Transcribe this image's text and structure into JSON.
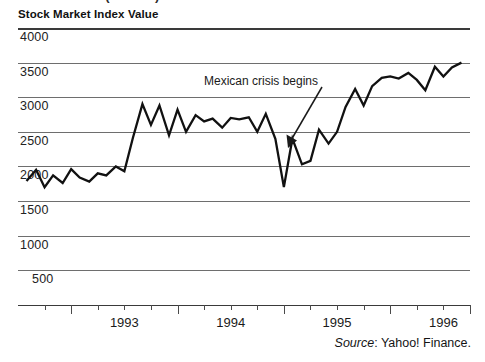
{
  "clipped_header": "Stock Market (Mexico)",
  "chart_title": "Stock Market Index Value",
  "source": {
    "word": "Source",
    "rest": ": Yahoo! Finance."
  },
  "annotation": {
    "text": "Mexican crisis begins"
  },
  "colors": {
    "line": "#111111",
    "grid": "#6e6e6e",
    "axis": "#3a3a3a",
    "text": "#1a1a1a",
    "background": "#ffffff"
  },
  "chart_data": {
    "type": "line",
    "title": "Stock Market Index Value",
    "xlabel": "",
    "ylabel": "Stock Market Index Value",
    "ylim": [
      0,
      4000
    ],
    "yticks": [
      4000,
      3500,
      3000,
      2500,
      2000,
      1500,
      1000,
      500
    ],
    "ytick_labels": [
      "4000",
      "3500",
      "3000",
      "2500",
      "2000",
      "1500",
      "1000",
      "500"
    ],
    "grid": true,
    "legend": false,
    "xlim": [
      1992.5,
      1996.75
    ],
    "xticks": [
      1993,
      1994,
      1995,
      1996
    ],
    "xtick_labels": [
      "1993",
      "1994",
      "1995",
      "1996"
    ],
    "minor_xticks": [
      1992.75,
      1993.25,
      1993.5,
      1993.75,
      1994.25,
      1994.5,
      1994.75,
      1995.25,
      1995.5,
      1995.75,
      1996.25,
      1996.5
    ],
    "annotations": [
      {
        "text": "Mexican crisis begins",
        "point_x": 1994.82,
        "point_y": 2450,
        "label_x": 1994.35,
        "label_y": 3330
      }
    ],
    "series": [
      {
        "name": "Stock Market Index Value",
        "x": [
          1992.58,
          1992.67,
          1992.75,
          1992.83,
          1992.92,
          1993.0,
          1993.08,
          1993.17,
          1993.25,
          1993.33,
          1993.42,
          1993.5,
          1993.58,
          1993.67,
          1993.75,
          1993.83,
          1993.92,
          1994.0,
          1994.08,
          1994.17,
          1994.25,
          1994.33,
          1994.42,
          1994.5,
          1994.58,
          1994.67,
          1994.75,
          1994.83,
          1994.92,
          1995.0,
          1995.08,
          1995.17,
          1995.25,
          1995.33,
          1995.42,
          1995.5,
          1995.58,
          1995.67,
          1995.75,
          1995.83,
          1995.92,
          1996.0,
          1996.08,
          1996.17,
          1996.25,
          1996.33,
          1996.42,
          1996.5,
          1996.58,
          1996.67
        ],
        "y": [
          1790,
          1950,
          1700,
          1870,
          1760,
          1960,
          1840,
          1780,
          1900,
          1870,
          2000,
          1930,
          2410,
          2900,
          2600,
          2880,
          2450,
          2820,
          2500,
          2740,
          2650,
          2690,
          2560,
          2700,
          2680,
          2710,
          2500,
          2760,
          2400,
          1700,
          2400,
          2030,
          2080,
          2530,
          2330,
          2500,
          2860,
          3120,
          2880,
          3160,
          3280,
          3300,
          3270,
          3350,
          3250,
          3100,
          3440,
          3300,
          3430,
          3500
        ],
        "values_note": "index level"
      }
    ]
  }
}
